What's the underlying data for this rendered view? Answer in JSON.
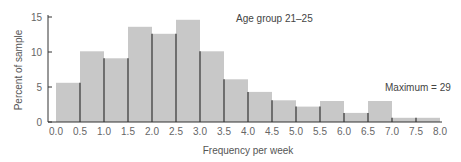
{
  "chart_data": {
    "type": "bar",
    "subtype": "histogram",
    "title": "",
    "xlabel": "Frequency per week",
    "ylabel": "Percent of sample",
    "categories": [
      "0.0-0.5",
      "0.5-1.0",
      "1.0-1.5",
      "1.5-2.0",
      "2.0-2.5",
      "2.5-3.0",
      "3.0-3.5",
      "3.5-4.0",
      "4.0-4.5",
      "4.5-5.0",
      "5.0-5.5",
      "5.5-6.0",
      "6.0-6.5",
      "6.5-7.0",
      "7.0-7.5",
      "7.5-8.0"
    ],
    "values": [
      5.6,
      10.1,
      9.1,
      13.6,
      12.6,
      14.6,
      10.1,
      6.1,
      4.3,
      3.1,
      2.2,
      3.0,
      1.3,
      3.0,
      0.6,
      0.6
    ],
    "x_ticks": [
      "0.0",
      "0.5",
      "1.0",
      "1.5",
      "2.0",
      "2.5",
      "3.0",
      "3.5",
      "4.0",
      "4.5",
      "5.0",
      "5.5",
      "6.0",
      "6.5",
      "7.0",
      "7.5",
      "8.0"
    ],
    "y_ticks": [
      "0",
      "5",
      "10",
      "15"
    ],
    "ylim": [
      0,
      15
    ],
    "xlim": [
      0,
      8
    ],
    "grid": false,
    "legend": null,
    "annotations": [
      "Age group 21-25",
      "Maximum = 29"
    ],
    "bar_color": "#c8c8c8",
    "edge_color": "#333333"
  },
  "labels": {
    "group": "Age group 21–25",
    "maximum": "Maximum = 29",
    "xlabel": "Frequency per week",
    "ylabel": "Percent of sample"
  }
}
